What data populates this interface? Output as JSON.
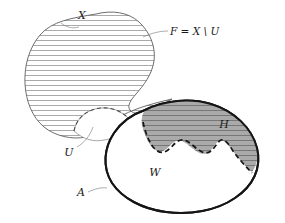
{
  "figure": {
    "width": 285,
    "height": 223,
    "background_color": "#ffffff"
  },
  "labels": {
    "x": "X",
    "f_definition": "F = X \\ U",
    "u": "U",
    "a": "A",
    "w": "W",
    "h": "H"
  },
  "regions": [
    {
      "name": "X",
      "label": "X",
      "fill": "#ffffff",
      "pattern": "horizontal-hatch",
      "hatch_color": "#7c7c7c",
      "outline_color": "#5d5d5d",
      "description": "large hatched blob upper left"
    },
    {
      "name": "F",
      "label": "F = X \\ U",
      "description": "hatched portion of X excluding U, leader line to X boundary"
    },
    {
      "name": "U",
      "label": "U",
      "fill": "#ffffff",
      "outline_color": "#8f8f8f",
      "description": "unhatched notch removed from lower boundary of X, dashed upper arc"
    },
    {
      "name": "W",
      "label": "W",
      "fill": "#ffffff",
      "outline_color": "#151515",
      "description": "tilted ellipse with thick black boundary A"
    },
    {
      "name": "A",
      "label": "A",
      "description": "boundary curve of the ellipse W"
    },
    {
      "name": "H",
      "label": "H",
      "fill": "#aaaaaa",
      "pattern": "horizontal-hatch",
      "hatch_color": "#6a6a6a",
      "boundary_style": "dashed",
      "description": "gray hatched region inside ellipse, wavy dashed lower boundary"
    }
  ],
  "colors": {
    "ink": "#151515",
    "hatch_light": "#7c7c7c",
    "hatch_dark": "#6a6a6a",
    "gray_fill": "#aaaaaa",
    "leader": "#8a8a8a",
    "blob_outline": "#5d5d5d"
  }
}
